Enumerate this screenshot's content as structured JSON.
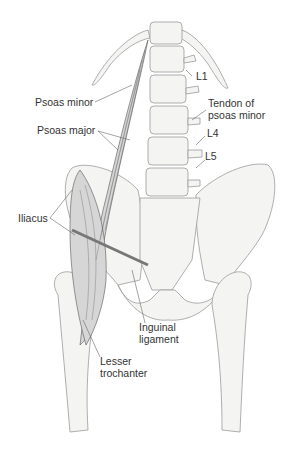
{
  "figure": {
    "type": "anatomical illustration",
    "labels": {
      "psoas_minor": "Psoas minor",
      "psoas_major": "Psoas major",
      "iliacus": "Iliacus",
      "l1": "L1",
      "tendon_psoas_minor_line1": "Tendon of",
      "tendon_psoas_minor_line2": "psoas minor",
      "l4": "L4",
      "l5": "L5",
      "inguinal_line1": "Inguinal",
      "inguinal_line2": "ligament",
      "lesser_line1": "Lesser",
      "lesser_line2": "trochanter"
    }
  }
}
